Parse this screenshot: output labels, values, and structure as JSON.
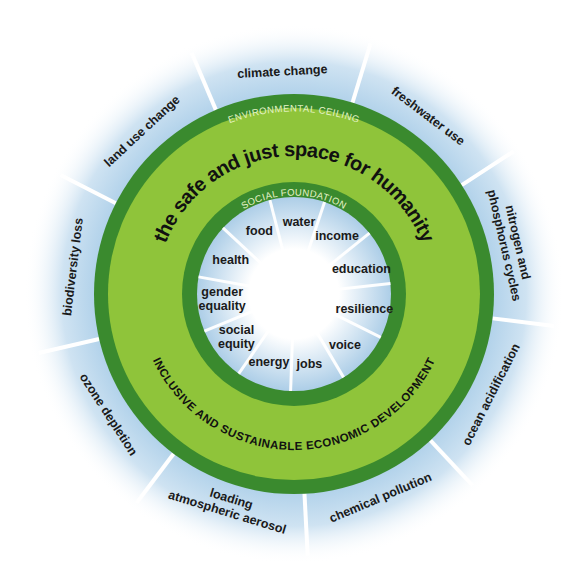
{
  "diagram": {
    "title": "the safe and just space for humanity",
    "environmental_ceiling_label": "ENVIRONMENTAL CEILING",
    "social_foundation_label": "SOCIAL FOUNDATION",
    "economic_label": "INCLUSIVE AND SUSTAINABLE ECONOMIC DEVELOPMENT",
    "planetary_boundaries": [
      {
        "lines": [
          "climate change"
        ]
      },
      {
        "lines": [
          "freshwater use"
        ]
      },
      {
        "lines": [
          "nitrogen and",
          "phosphorus cycles"
        ]
      },
      {
        "lines": [
          "ocean acidification"
        ]
      },
      {
        "lines": [
          "chemical pollution"
        ]
      },
      {
        "lines": [
          "atmospheric aerosol",
          "loading"
        ]
      },
      {
        "lines": [
          "ozone depletion"
        ]
      },
      {
        "lines": [
          "biodiversity loss"
        ]
      },
      {
        "lines": [
          "land use change"
        ]
      }
    ],
    "social_foundation": [
      {
        "lines": [
          "water"
        ]
      },
      {
        "lines": [
          "income"
        ]
      },
      {
        "lines": [
          "education"
        ]
      },
      {
        "lines": [
          "resilience"
        ]
      },
      {
        "lines": [
          "voice"
        ]
      },
      {
        "lines": [
          "jobs"
        ]
      },
      {
        "lines": [
          "energy"
        ]
      },
      {
        "lines": [
          "social",
          "equity"
        ]
      },
      {
        "lines": [
          "gender",
          "equality"
        ]
      },
      {
        "lines": [
          "health"
        ]
      },
      {
        "lines": [
          "food"
        ]
      }
    ],
    "colors": {
      "dark_green": "#3a8a2e",
      "light_green": "#8fc43a",
      "halo_blue": "#a9cde8",
      "band_text": "#e6f3c8",
      "text": "#1a1a1a"
    }
  }
}
